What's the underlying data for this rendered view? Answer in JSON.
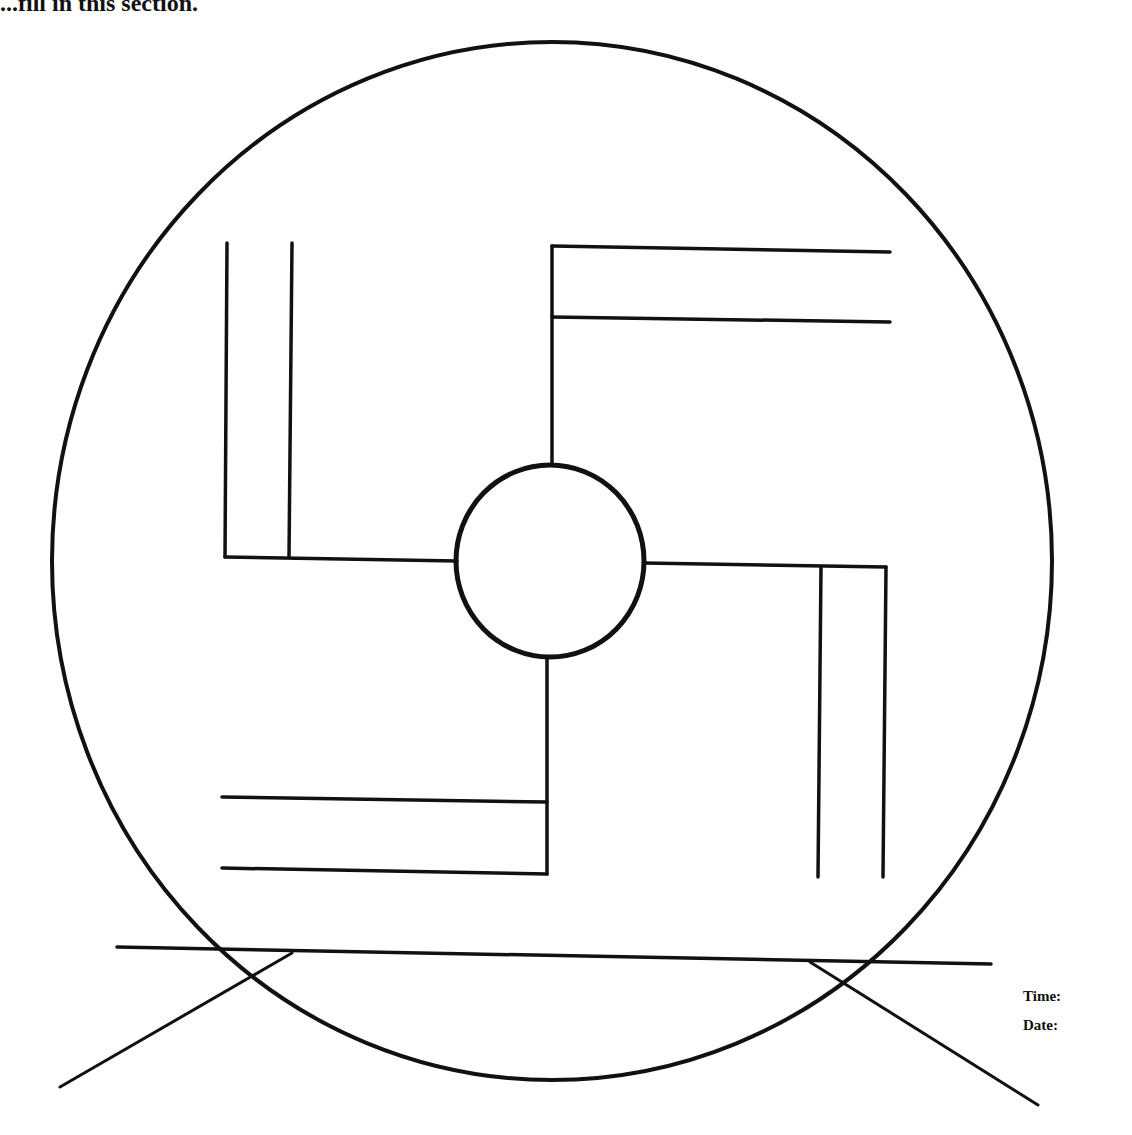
{
  "header": {
    "instruction_text": "...fill in this section."
  },
  "fields": {
    "time_label": "Time:",
    "date_label": "Date:"
  },
  "figure": {
    "stroke_color": "#111111",
    "background_color": "#ffffff",
    "outer_circle": {
      "cx": 552,
      "cy": 561,
      "rx": 500,
      "ry": 519,
      "stroke_width": 4
    },
    "inner_circle": {
      "cx": 550,
      "cy": 561,
      "rx": 94,
      "ry": 96,
      "stroke_width": 5
    },
    "arms": [
      {
        "name": "top-left-arm",
        "segments": [
          [
            227,
            243,
            225,
            557
          ],
          [
            292,
            243,
            289,
            557
          ],
          [
            225,
            557,
            457,
            561
          ]
        ]
      },
      {
        "name": "top-right-arm",
        "segments": [
          [
            552,
            465,
            552,
            246
          ],
          [
            552,
            246,
            890,
            252
          ],
          [
            552,
            317,
            890,
            322
          ]
        ]
      },
      {
        "name": "bottom-right-arm",
        "segments": [
          [
            644,
            563,
            886,
            567
          ],
          [
            821,
            567,
            818,
            877
          ],
          [
            886,
            567,
            883,
            877
          ]
        ]
      },
      {
        "name": "bottom-left-arm",
        "segments": [
          [
            547,
            657,
            547,
            874
          ],
          [
            222,
            797,
            547,
            802
          ],
          [
            222,
            868,
            547,
            874
          ]
        ]
      }
    ],
    "stand": {
      "base_line": [
        117,
        947,
        991,
        964
      ],
      "left_leg": [
        292,
        953,
        60,
        1087
      ],
      "right_leg": [
        810,
        962,
        1038,
        1105
      ]
    }
  }
}
